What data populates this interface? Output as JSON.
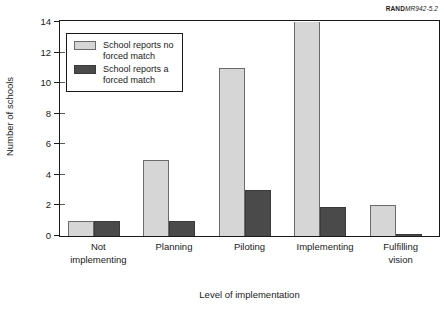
{
  "corner_tag": {
    "brand": "RAND",
    "code": "MR942-5.2"
  },
  "chart_data": {
    "type": "bar",
    "title": "",
    "xlabel": "Level of implementation",
    "ylabel": "Number of schools",
    "categories": [
      "Not\nimplementing",
      "Planning",
      "Piloting",
      "Implementing",
      "Fulfilling\nvision"
    ],
    "series": [
      {
        "name": "School reports no\nforced match",
        "color": "#d6d6d6",
        "values": [
          1,
          5,
          11,
          14,
          2
        ]
      },
      {
        "name": "School reports a\nforced match",
        "color": "#4a4a4a",
        "values": [
          1,
          1,
          3,
          1.9,
          0.1
        ]
      }
    ],
    "ylim": [
      0,
      14
    ],
    "yticks": [
      0,
      2,
      4,
      6,
      8,
      10,
      12,
      14
    ],
    "ytick_labels": [
      "0",
      "2",
      "4",
      "6",
      "8",
      "10",
      "12",
      "14"
    ],
    "grid": false,
    "legend_position": "upper-left"
  }
}
